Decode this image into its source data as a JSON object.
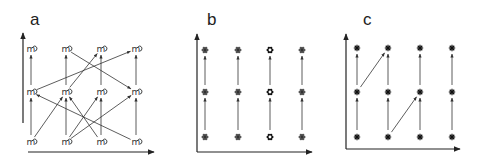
{
  "figure": {
    "background": "#ffffff",
    "stroke_color": "#333333",
    "panels": [
      {
        "id": "a",
        "label": "a",
        "label_pos": [
          30,
          11
        ],
        "node_glyph": "mushroom-glyph",
        "node_char": "m",
        "axis": {
          "origin": [
            23,
            152
          ],
          "y_top": 33,
          "y_axis_bottom": 123,
          "x_start": 28,
          "x_end": 154
        },
        "columns_x": [
          31,
          66,
          101,
          136
        ],
        "rows_y": [
          49,
          92,
          142
        ],
        "vertical_edges": true,
        "diagonal_edges": [
          {
            "from": [
              0,
              1
            ],
            "to": [
              3,
              0
            ]
          },
          {
            "from": [
              1,
              0
            ],
            "to": [
              3,
              1
            ]
          },
          {
            "from": [
              1,
              1
            ],
            "to": [
              2,
              0
            ]
          },
          {
            "from": [
              0,
              2
            ],
            "to": [
              1,
              1
            ]
          },
          {
            "from": [
              3,
              2
            ],
            "to": [
              0,
              1
            ]
          },
          {
            "from": [
              2,
              2
            ],
            "to": [
              1,
              1
            ]
          },
          {
            "from": [
              1,
              2
            ],
            "to": [
              2,
              1
            ]
          },
          {
            "from": [
              1,
              2
            ],
            "to": [
              3,
              1
            ]
          }
        ]
      },
      {
        "id": "b",
        "label": "b",
        "label_pos": [
          207,
          11
        ],
        "node_glyph": "flower-glyph",
        "highlight_column": 2,
        "axis": {
          "origin": [
            197,
            152
          ],
          "y_top": 34,
          "y_axis_bottom": 152,
          "x_start": 197,
          "x_end": 312
        },
        "columns_x": [
          205,
          238,
          270,
          302
        ],
        "rows_y": [
          50,
          92,
          137
        ],
        "vertical_edges": true,
        "diagonal_edges": []
      },
      {
        "id": "c",
        "label": "c",
        "label_pos": [
          363,
          11
        ],
        "node_glyph": "asterisk-glyph",
        "axis": {
          "origin": [
            346,
            149
          ],
          "y_top": 34,
          "y_axis_bottom": 149,
          "x_start": 346,
          "x_end": 460
        },
        "columns_x": [
          357,
          388,
          420,
          452
        ],
        "rows_y": [
          48,
          92,
          137
        ],
        "vertical_edges": true,
        "diagonal_edges": [
          {
            "from": [
              0,
              1
            ],
            "to": [
              1,
              0
            ]
          },
          {
            "from": [
              1,
              2
            ],
            "to": [
              2,
              1
            ]
          }
        ]
      }
    ]
  }
}
